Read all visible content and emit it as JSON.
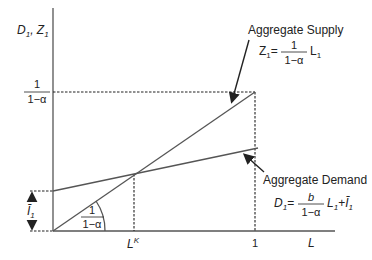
{
  "diagram": {
    "y_axis_label": "D",
    "y_axis_label_sub": "1",
    "y_axis_label_2": "Z",
    "y_axis_label_2_sub": "1",
    "x_axis_label": "L",
    "x_tick_LK": "L",
    "x_tick_LK_sup": "K",
    "x_tick_one": "1",
    "y_tick_num": "1",
    "y_tick_den": "1−α",
    "intercept_label": "Ī",
    "intercept_label_sub": "1",
    "slope_num": "1",
    "slope_den": "1−α",
    "supply": {
      "title": "Aggregate Supply",
      "lhs": "Z",
      "lhs_sub": "1",
      "eq": "=",
      "frac_num": "1",
      "frac_den": "1−α",
      "rhs": "L",
      "rhs_sub": "1"
    },
    "demand": {
      "title": "Aggregate Demand",
      "lhs": "D",
      "lhs_sub": "1",
      "eq": "=",
      "frac_num": "b",
      "frac_den": "1−α",
      "rhs": "L",
      "rhs_sub": "1",
      "plus": "+",
      "rhs2": "Ī",
      "rhs2_sub": "1"
    }
  }
}
